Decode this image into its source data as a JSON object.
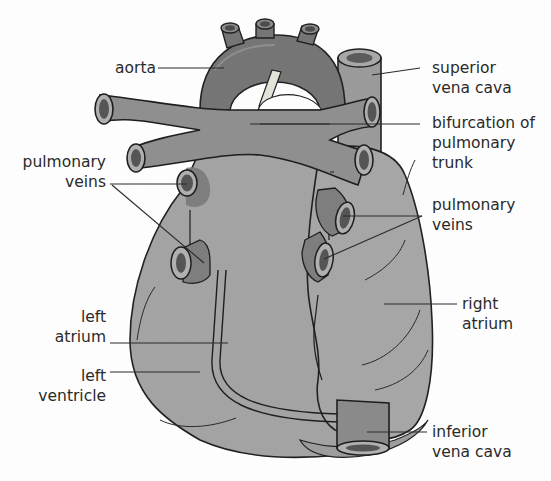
{
  "diagram": {
    "colors": {
      "heart_fill": "#a3a3a3",
      "vessel_fill": "#8f8f8f",
      "dark_fill": "#6e6e6e",
      "lumen": "#4a4a4a",
      "outline": "#1e1e1e",
      "text": "#2a2a2a"
    },
    "labels": {
      "aorta": "aorta",
      "superior_vena_cava": [
        "superior",
        "vena cava"
      ],
      "bifurcation": [
        "bifurcation of",
        "pulmonary",
        "trunk"
      ],
      "pulmonary_veins_left": [
        "pulmonary",
        "veins"
      ],
      "pulmonary_veins_right": [
        "pulmonary",
        "veins"
      ],
      "left_atrium": [
        "left",
        "atrium"
      ],
      "left_ventricle": [
        "left",
        "ventricle"
      ],
      "right_atrium": [
        "right",
        "atrium"
      ],
      "inferior_vena_cava": [
        "inferior",
        "vena cava"
      ]
    }
  }
}
